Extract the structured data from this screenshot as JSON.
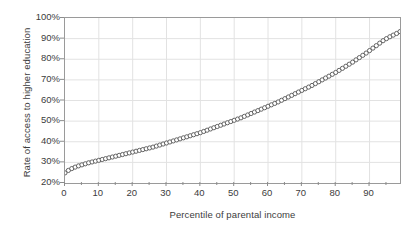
{
  "chart_data": {
    "type": "scatter",
    "title": "",
    "subtitle": "",
    "xlabel": "Percentile of parental income",
    "ylabel": "Rate of access to higher education",
    "xlim": [
      0,
      99
    ],
    "ylim": [
      20,
      100
    ],
    "xticks": [
      0,
      10,
      20,
      30,
      40,
      50,
      60,
      70,
      80,
      90
    ],
    "xtick_labels": [
      "0",
      "10",
      "20",
      "30",
      "40",
      "50",
      "60",
      "70",
      "80",
      "90"
    ],
    "x_minor_tick_step": 5,
    "yticks": [
      20,
      30,
      40,
      50,
      60,
      70,
      80,
      90,
      100
    ],
    "ytick_labels": [
      "20%",
      "30%",
      "40%",
      "50%",
      "60%",
      "70%",
      "80%",
      "90%",
      "100%"
    ],
    "grid": true,
    "grid_color": "#e2e2e2",
    "legend": false,
    "legend_position": "none",
    "marker": "open-circle",
    "marker_color": "#555555",
    "line_color": "#333333",
    "series": [
      {
        "name": "Rate of access to higher education",
        "x": [
          0,
          1,
          2,
          3,
          4,
          5,
          6,
          7,
          8,
          9,
          10,
          11,
          12,
          13,
          14,
          15,
          16,
          17,
          18,
          19,
          20,
          21,
          22,
          23,
          24,
          25,
          26,
          27,
          28,
          29,
          30,
          31,
          32,
          33,
          34,
          35,
          36,
          37,
          38,
          39,
          40,
          41,
          42,
          43,
          44,
          45,
          46,
          47,
          48,
          49,
          50,
          51,
          52,
          53,
          54,
          55,
          56,
          57,
          58,
          59,
          60,
          61,
          62,
          63,
          64,
          65,
          66,
          67,
          68,
          69,
          70,
          71,
          72,
          73,
          74,
          75,
          76,
          77,
          78,
          79,
          80,
          81,
          82,
          83,
          84,
          85,
          86,
          87,
          88,
          89,
          90,
          91,
          92,
          93,
          94,
          95,
          96,
          97,
          98,
          99
        ],
        "y": [
          24.9,
          26.1,
          27.0,
          27.7,
          28.3,
          28.8,
          29.3,
          29.8,
          30.2,
          30.6,
          31.0,
          31.4,
          31.8,
          32.2,
          32.6,
          33.0,
          33.4,
          33.8,
          34.2,
          34.6,
          35.0,
          35.4,
          35.8,
          36.2,
          36.6,
          37.0,
          37.4,
          37.9,
          38.4,
          38.9,
          39.4,
          39.9,
          40.4,
          40.9,
          41.4,
          41.9,
          42.4,
          42.9,
          43.4,
          43.9,
          44.4,
          45.0,
          45.6,
          46.2,
          46.8,
          47.4,
          48.0,
          48.6,
          49.2,
          49.8,
          50.4,
          51.0,
          51.6,
          52.3,
          53.0,
          53.7,
          54.4,
          55.1,
          55.8,
          56.5,
          57.2,
          57.9,
          58.6,
          59.3,
          60.1,
          60.9,
          61.7,
          62.5,
          63.3,
          64.1,
          64.9,
          65.7,
          66.5,
          67.3,
          68.2,
          69.1,
          70.0,
          70.9,
          71.8,
          72.7,
          73.6,
          74.6,
          75.6,
          76.6,
          77.6,
          78.6,
          79.7,
          80.8,
          81.9,
          83.0,
          84.2,
          85.4,
          86.6,
          87.8,
          89.0,
          90.0,
          90.9,
          91.7,
          92.5,
          93.4
        ]
      }
    ]
  }
}
